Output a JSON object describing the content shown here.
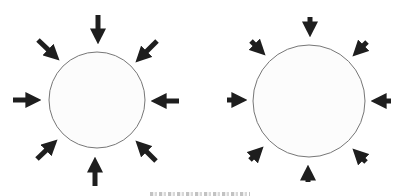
{
  "figure": {
    "colors": {
      "background": "#ffffff",
      "circle_stroke": "#777777",
      "circle_fill": "#fcfcfc",
      "arrow": "#1e1e1e"
    },
    "panels": [
      {
        "id": "left",
        "circle": {
          "cx": 97,
          "cy": 100,
          "r": 48
        },
        "arrows": [
          {
            "dir": "down",
            "x1": 98,
            "y1": 15,
            "x2": 98,
            "y2": 45
          },
          {
            "dir": "down-left",
            "x1": 157,
            "y1": 41,
            "x2": 135,
            "y2": 63
          },
          {
            "dir": "left",
            "x1": 179,
            "y1": 101,
            "x2": 150,
            "y2": 101
          },
          {
            "dir": "up-left",
            "x1": 156,
            "y1": 161,
            "x2": 135,
            "y2": 140
          },
          {
            "dir": "up",
            "x1": 95,
            "y1": 186,
            "x2": 95,
            "y2": 156
          },
          {
            "dir": "up-right",
            "x1": 37,
            "y1": 159,
            "x2": 58,
            "y2": 139
          },
          {
            "dir": "right",
            "x1": 13,
            "y1": 100,
            "x2": 42,
            "y2": 100
          },
          {
            "dir": "down-right",
            "x1": 38,
            "y1": 40,
            "x2": 60,
            "y2": 61
          }
        ]
      },
      {
        "id": "right",
        "circle": {
          "cx": 309,
          "cy": 101,
          "r": 56
        },
        "arrows": [
          {
            "dir": "down",
            "x1": 310,
            "y1": 17,
            "x2": 310,
            "y2": 38
          },
          {
            "dir": "down-left",
            "x1": 367,
            "y1": 42,
            "x2": 352,
            "y2": 57
          },
          {
            "dir": "left",
            "x1": 391,
            "y1": 101,
            "x2": 370,
            "y2": 101
          },
          {
            "dir": "up-left",
            "x1": 366,
            "y1": 162,
            "x2": 352,
            "y2": 148
          },
          {
            "dir": "up",
            "x1": 308,
            "y1": 182,
            "x2": 308,
            "y2": 164
          },
          {
            "dir": "up-right",
            "x1": 250,
            "y1": 160,
            "x2": 264,
            "y2": 146
          },
          {
            "dir": "right",
            "x1": 227,
            "y1": 100,
            "x2": 248,
            "y2": 100
          },
          {
            "dir": "down-right",
            "x1": 251,
            "y1": 41,
            "x2": 266,
            "y2": 56
          }
        ]
      }
    ],
    "caption": {
      "visible": "partially clipped at bottom edge",
      "text": ""
    }
  }
}
